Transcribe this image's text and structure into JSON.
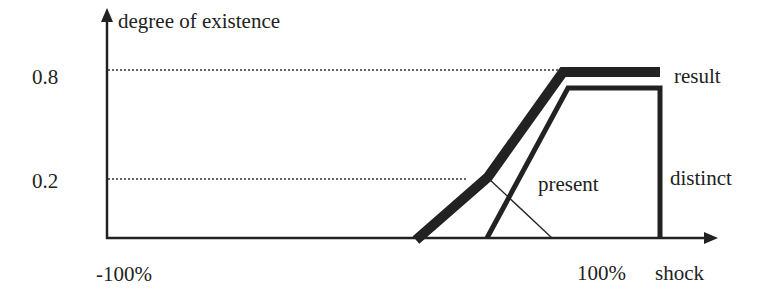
{
  "diagram": {
    "y_axis_label": "degree of existence",
    "x_axis_label": "shock",
    "y_ticks": [
      {
        "label": "0.8",
        "value": 0.8
      },
      {
        "label": "0.2",
        "value": 0.2
      }
    ],
    "x_ticks": [
      {
        "label": "-100%",
        "value": -100
      },
      {
        "label": "100%",
        "value": 100
      }
    ],
    "curves": [
      {
        "name": "result",
        "label": "result",
        "style": "thick"
      },
      {
        "name": "distinct",
        "label": "distinct",
        "style": "medium"
      },
      {
        "name": "present",
        "label": "present",
        "style": "thin"
      }
    ],
    "colors": {
      "ink": "#222222",
      "background": "#ffffff"
    }
  }
}
